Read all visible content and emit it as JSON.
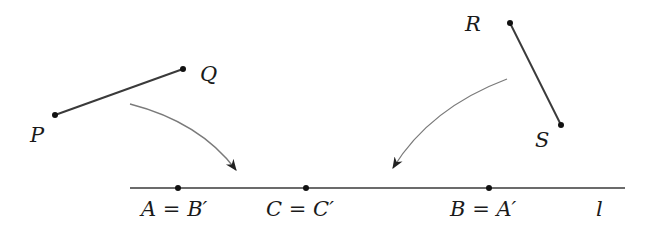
{
  "diagram": {
    "type": "reflection-isometry-illustration",
    "segments": [
      {
        "name": "PQ",
        "from": {
          "label": "P",
          "x": 55,
          "y": 115
        },
        "to": {
          "label": "Q",
          "x": 183,
          "y": 69
        }
      },
      {
        "name": "RS",
        "from": {
          "label": "R",
          "x": 510,
          "y": 23
        },
        "to": {
          "label": "S",
          "x": 561,
          "y": 125
        }
      }
    ],
    "line": {
      "label": "l",
      "x1": 130,
      "y1": 188,
      "x2": 625,
      "y2": 188
    },
    "line_points": [
      {
        "x": 178,
        "y": 188,
        "label": "A = B′"
      },
      {
        "x": 306,
        "y": 188,
        "label": "C = C′"
      },
      {
        "x": 489,
        "y": 188,
        "label": "B = A′"
      }
    ],
    "arrows": [
      {
        "from": "PQ",
        "to": "line",
        "start": [
          130,
          104
        ],
        "end": [
          236,
          170
        ]
      },
      {
        "from": "RS",
        "to": "line",
        "start": [
          507,
          79
        ],
        "end": [
          393,
          168
        ]
      }
    ]
  },
  "labels": {
    "P": "P",
    "Q": "Q",
    "R": "R",
    "S": "S",
    "l": "l",
    "A": "A",
    "B_prime": "B′",
    "C": "C",
    "C_prime": "C′",
    "B": "B",
    "A_prime": "A′",
    "equals": "="
  },
  "colors": {
    "segment": "#333333",
    "arrow": "#777777",
    "point": "#111111",
    "text": "#1a1a1a"
  }
}
